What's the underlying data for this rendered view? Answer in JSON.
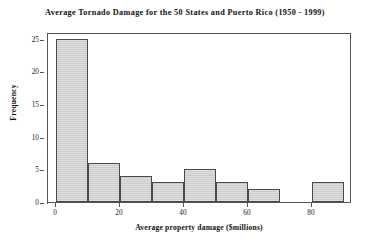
{
  "chart_data": {
    "type": "bar",
    "title": "Average Tornado Damage for the 50 States and Puerto Rico (1950 - 1999)",
    "xlabel": "Average property damage ($millions)",
    "ylabel": "Frequency",
    "bin_width": 10,
    "bin_starts": [
      0,
      10,
      20,
      30,
      40,
      50,
      60,
      70,
      80
    ],
    "categories": [
      "0-10",
      "10-20",
      "20-30",
      "30-40",
      "40-50",
      "50-60",
      "60-70",
      "70-80",
      "80-90"
    ],
    "values": [
      25,
      6,
      4,
      3,
      5,
      3,
      2,
      0,
      3
    ],
    "xlim": [
      0,
      95
    ],
    "ylim": [
      0,
      26
    ],
    "xticks": [
      0,
      20,
      40,
      60,
      80
    ],
    "xtick_labels": [
      "0",
      "20",
      "40",
      "60",
      "80"
    ],
    "yticks": [
      0,
      5,
      10,
      15,
      20,
      25
    ],
    "ytick_labels": [
      "0",
      "5",
      "10",
      "15",
      "20",
      "25"
    ],
    "grid": false,
    "legend": null,
    "bar_fill_color": "#cfcfcf",
    "bar_edge_color": "#4a4a4a",
    "axis_color": "#555555",
    "background_color": "#ffffff"
  }
}
